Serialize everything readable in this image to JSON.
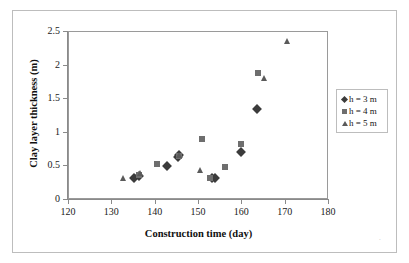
{
  "chart_data": {
    "type": "scatter",
    "title": "",
    "xlabel": "Construction time (day)",
    "ylabel": "Clay layer thickness (m)",
    "xlim": [
      120,
      180
    ],
    "ylim": [
      0,
      2.5
    ],
    "xticks": [
      120,
      130,
      140,
      150,
      160,
      170,
      180
    ],
    "yticks": [
      0,
      0.5,
      1,
      1.5,
      2,
      2.5
    ],
    "xtick_labels": [
      "120",
      "130",
      "140",
      "150",
      "160",
      "170",
      "180"
    ],
    "ytick_labels": [
      "0",
      "0.5",
      "1",
      "1.5",
      "2",
      "2.5"
    ],
    "grid": false,
    "legend_position": "right",
    "series": [
      {
        "name": "h = 3 m",
        "marker": "diamond",
        "color": "#3b3b3b",
        "points": [
          {
            "x": 135.0,
            "y": 0.33
          },
          {
            "x": 136.1,
            "y": 0.36
          },
          {
            "x": 142.5,
            "y": 0.51
          },
          {
            "x": 145.2,
            "y": 0.64
          },
          {
            "x": 145.4,
            "y": 0.67
          },
          {
            "x": 152.9,
            "y": 0.32
          },
          {
            "x": 153.8,
            "y": 0.32
          },
          {
            "x": 159.6,
            "y": 0.71
          },
          {
            "x": 163.4,
            "y": 1.35
          }
        ]
      },
      {
        "name": "h = 4 m",
        "marker": "square",
        "color": "#6e6e6e",
        "points": [
          {
            "x": 136.2,
            "y": 0.37
          },
          {
            "x": 140.2,
            "y": 0.54
          },
          {
            "x": 145.3,
            "y": 0.66
          },
          {
            "x": 150.6,
            "y": 0.91
          },
          {
            "x": 152.6,
            "y": 0.32
          },
          {
            "x": 156.1,
            "y": 0.49
          },
          {
            "x": 159.6,
            "y": 0.84
          },
          {
            "x": 163.5,
            "y": 1.89
          }
        ]
      },
      {
        "name": "h = 5 m",
        "marker": "triangle",
        "color": "#5a5a5a",
        "points": [
          {
            "x": 132.4,
            "y": 0.33
          },
          {
            "x": 136.4,
            "y": 0.4
          },
          {
            "x": 145.3,
            "y": 0.67
          },
          {
            "x": 150.3,
            "y": 0.44
          },
          {
            "x": 165.0,
            "y": 1.81
          },
          {
            "x": 170.2,
            "y": 2.36
          }
        ]
      }
    ]
  },
  "legend": {
    "items": [
      {
        "label": "h = 3 m",
        "marker": "diamond"
      },
      {
        "label": "h = 4 m",
        "marker": "square"
      },
      {
        "label": "h = 5 m",
        "marker": "triangle"
      }
    ]
  }
}
